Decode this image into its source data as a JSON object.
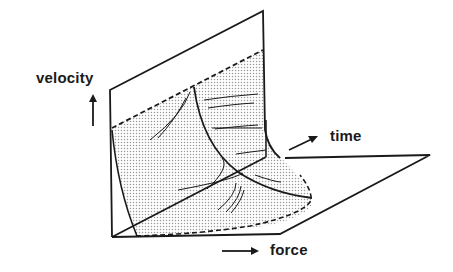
{
  "diagram": {
    "type": "3d-surface-sketch",
    "axes": {
      "vertical": {
        "label": "velocity",
        "arrow": "up"
      },
      "depth": {
        "label": "time",
        "arrow": "up-right"
      },
      "horizontal": {
        "label": "force",
        "arrow": "right"
      }
    },
    "colors": {
      "line": "#1a1a1a",
      "shade": "#c8c8c8",
      "background": "#ffffff"
    }
  }
}
